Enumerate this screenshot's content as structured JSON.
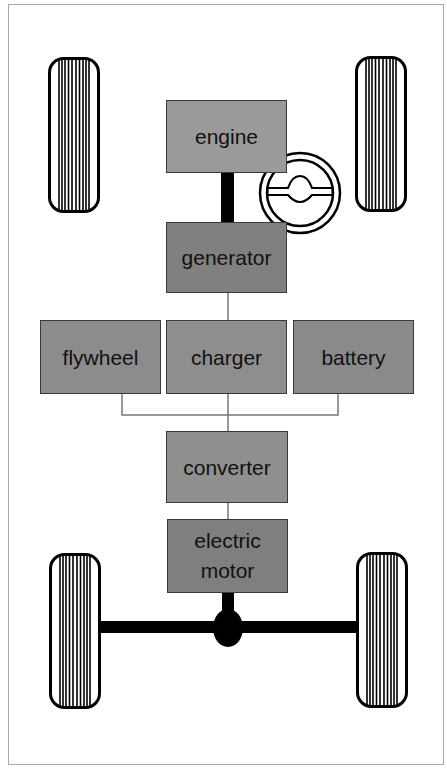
{
  "diagram": {
    "type": "series hybrid vehicle drivetrain",
    "components": {
      "engine": {
        "label": "engine",
        "color": "#9a9a9a"
      },
      "generator": {
        "label": "generator",
        "color": "#808080"
      },
      "flywheel": {
        "label": "flywheel",
        "color": "#8c8c8c"
      },
      "charger": {
        "label": "charger",
        "color": "#8e8e8e"
      },
      "battery": {
        "label": "battery",
        "color": "#8a8a8a"
      },
      "converter": {
        "label": "converter",
        "color": "#8f8f8f"
      },
      "electric_motor": {
        "label_line1": "electric",
        "label_line2": "motor",
        "color": "#7f7f7f"
      }
    },
    "icons": [
      "tire-icon",
      "steering-wheel-icon",
      "differential-icon"
    ],
    "line_color": "#777777",
    "shaft_color": "#000000",
    "frame_color": "#a8a8a8"
  }
}
